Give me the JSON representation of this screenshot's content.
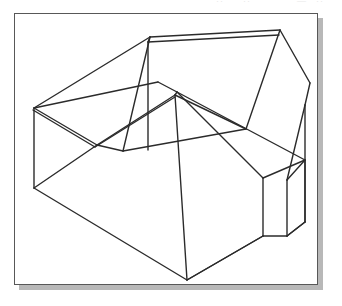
{
  "image": {
    "kind": "line-drawing",
    "subject": "isometric-wireframe-solid",
    "description": "Black-and-white isometric wireframe line drawing of a multi-faceted block shape inside a thin rectangular frame with a light gray drop shadow.",
    "background_color": "#ffffff",
    "stroke_color": "#2b2b2b",
    "frame_border_color": "#585858",
    "shadow_color": "#b8b8b8",
    "frame": {
      "x": 14,
      "y": 13,
      "width": 304,
      "height": 272,
      "shadow_offset_x": 5,
      "shadow_offset_y": 5
    },
    "top_artifacts": [
      {
        "text": "··",
        "left": 216
      },
      {
        "text": "··",
        "left": 243
      },
      {
        "text": "—",
        "left": 297
      },
      {
        "text": "··",
        "left": 316
      }
    ],
    "geometry": {
      "stroke_width": 1.4,
      "paths": [
        "M 34 108 L 34 188",
        "M 34 188 L 187 280",
        "M 187 280 L 263 236",
        "M 263 236 L 287 236",
        "M 287 236 L 305 222",
        "M 305 222 L 305 105",
        "M 305 105 L 310 83",
        "M 310 83 L 280 30",
        "M 280 30 L 150 37",
        "M 150 37 L 34 108",
        "M 34 108 L 97 145",
        "M 97 145 L 175 95",
        "M 175 95 L 177 92",
        "M 177 92 L 158 82",
        "M 158 82 L 34 108",
        "M 33 110 L 95 147",
        "M 95 147 L 175 97",
        "M 150 37 L 148 42",
        "M 148 42 L 279 35",
        "M 148 42 L 148 150",
        "M 150 37 L 123 151",
        "M 123 151 L 246 129",
        "M 246 129 L 280 30",
        "M 175 95 L 246 129",
        "M 175 95 L 187 280",
        "M 187 280 L 263 236",
        "M 177 92 L 305 160",
        "M 305 160 L 305 222",
        "M 177 92 L 263 178",
        "M 263 178 L 263 236",
        "M 263 178 L 305 160",
        "M 34 188 L 97 145",
        "M 123 151 L 97 145",
        "M 287 236 L 287 180",
        "M 287 180 L 305 160",
        "M 287 236 L 305 222",
        "M 305 105 L 287 180"
      ]
    }
  }
}
